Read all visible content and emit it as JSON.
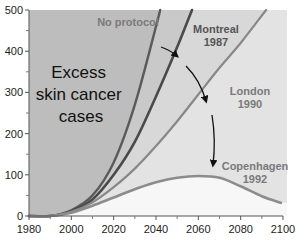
{
  "chart_data": {
    "type": "line",
    "title": "",
    "xlabel": "",
    "ylabel": "",
    "xlim": [
      1980,
      2100
    ],
    "ylim": [
      0,
      500
    ],
    "x_ticks": [
      1980,
      2000,
      2020,
      2040,
      2060,
      2080,
      2100
    ],
    "x_minor_ticks": [
      1990,
      2010,
      2030,
      2050,
      2070,
      2090
    ],
    "y_ticks": [
      0,
      100,
      200,
      300,
      400,
      500
    ],
    "y_minor_ticks": [
      50,
      150,
      250,
      350,
      450
    ],
    "grid": false,
    "area_annotation": [
      "Excess",
      "skin cancer",
      "cases"
    ],
    "series": [
      {
        "name": "No protocol",
        "label_lines": [
          "No protocol"
        ],
        "color": "#5a5a5a",
        "x": [
          1980,
          1990,
          2000,
          2010,
          2020,
          2030,
          2040,
          2042
        ],
        "values": [
          0,
          0,
          14,
          50,
          130,
          270,
          460,
          500
        ]
      },
      {
        "name": "Montreal 1987",
        "label_lines": [
          "Montreal",
          "1987"
        ],
        "color": "#4a4a4a",
        "x": [
          1980,
          1990,
          2000,
          2010,
          2020,
          2030,
          2040,
          2050,
          2057
        ],
        "values": [
          0,
          0,
          12,
          40,
          100,
          180,
          290,
          410,
          500
        ]
      },
      {
        "name": "London 1990",
        "label_lines": [
          "London",
          "1990"
        ],
        "color": "#888888",
        "x": [
          1980,
          1990,
          2000,
          2010,
          2020,
          2030,
          2040,
          2050,
          2060,
          2070,
          2080,
          2092
        ],
        "values": [
          0,
          0,
          10,
          33,
          70,
          115,
          170,
          230,
          295,
          360,
          420,
          500
        ]
      },
      {
        "name": "Copenhagen 1992",
        "label_lines": [
          "Copenhagen",
          "1992"
        ],
        "color": "#8c8c8c",
        "x": [
          1980,
          1990,
          2000,
          2010,
          2020,
          2030,
          2040,
          2050,
          2060,
          2070,
          2080,
          2090,
          2099
        ],
        "values": [
          0,
          0,
          8,
          25,
          45,
          65,
          82,
          93,
          97,
          93,
          72,
          48,
          32
        ]
      }
    ],
    "arrows": [
      {
        "from": "No protocol",
        "to": "Montreal 1987"
      },
      {
        "from": "Montreal 1987",
        "to": "London 1990"
      },
      {
        "from": "London 1990",
        "to": "Copenhagen 1992"
      }
    ],
    "legend": "inline labels"
  }
}
